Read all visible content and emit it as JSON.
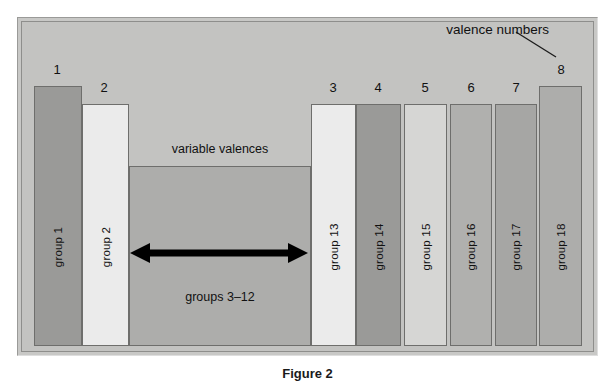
{
  "figure": {
    "caption": "Figure 2",
    "background_color": "#ffffff",
    "panel_color": "#c3c3c1",
    "frame_color": "#8e8e8c"
  },
  "annotation": {
    "line1": "valence numbers",
    "label": "valence numbers",
    "pointer_icon": "leader-line-icon"
  },
  "middle_block": {
    "top_caption": "variable valences",
    "bottom_caption": "groups 3–12",
    "arrow_icon": "double-headed-arrow-icon",
    "color": "#adadab"
  },
  "chart_data": {
    "type": "bar",
    "title": "",
    "xlabel": "",
    "ylabel": "",
    "categories": [
      "group 1",
      "group 2",
      "groups 3–12",
      "group 13",
      "group 14",
      "group 15",
      "group 16",
      "group 17",
      "group 18"
    ],
    "valence_numbers": [
      "1",
      "2",
      "",
      "3",
      "4",
      "5",
      "6",
      "7",
      "8"
    ],
    "values": [
      8,
      7,
      4,
      7,
      7,
      7,
      7,
      7,
      8
    ],
    "ylim": [
      0,
      8
    ],
    "grid": false,
    "legend": false
  },
  "bars": [
    {
      "label": "group 1",
      "valence": "1",
      "color": "#9a9a98",
      "x": 33,
      "width": 48,
      "top": 85,
      "num_x": 45,
      "num_y": 62
    },
    {
      "label": "group 2",
      "valence": "2",
      "color": "#ebebeb",
      "x": 81,
      "width": 47,
      "top": 103,
      "num_x": 92,
      "num_y": 80
    },
    {
      "label": "groups 3–12",
      "valence": "",
      "color": "#adadab",
      "x": 128,
      "width": 182,
      "top": 165,
      "num_x": 0,
      "num_y": 0
    },
    {
      "label": "group 13",
      "valence": "3",
      "color": "#ebebeb",
      "x": 310,
      "width": 45,
      "top": 103,
      "num_x": 321,
      "num_y": 80
    },
    {
      "label": "group 14",
      "valence": "4",
      "color": "#9a9a98",
      "x": 355,
      "width": 45,
      "top": 103,
      "num_x": 366,
      "num_y": 80
    },
    {
      "label": "group 15",
      "valence": "5",
      "color": "#d6d6d4",
      "x": 403,
      "width": 43,
      "top": 103,
      "num_x": 413,
      "num_y": 80
    },
    {
      "label": "group 16",
      "valence": "6",
      "color": "#b0b0ae",
      "x": 449,
      "width": 42,
      "top": 103,
      "num_x": 459,
      "num_y": 80
    },
    {
      "label": "group 17",
      "valence": "7",
      "color": "#a6a6a4",
      "x": 494,
      "width": 42,
      "top": 103,
      "num_x": 504,
      "num_y": 80
    },
    {
      "label": "group 18",
      "valence": "8",
      "color": "#adadab",
      "x": 538,
      "width": 43,
      "top": 85,
      "num_x": 549,
      "num_y": 62
    }
  ],
  "geometry": {
    "bars_bottom": 345
  }
}
